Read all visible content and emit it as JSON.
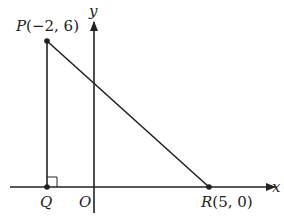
{
  "diagram": {
    "axes": {
      "x_label": "x",
      "y_label": "y",
      "origin_label": "O"
    },
    "points": {
      "P": {
        "name": "P",
        "coords": "(−2, 6)"
      },
      "Q": {
        "name": "Q"
      },
      "R": {
        "name": "R",
        "coords": "(5, 0)"
      }
    },
    "right_angle_at": "Q",
    "colors": {
      "line": "#222222",
      "background": "#ffffff"
    }
  }
}
